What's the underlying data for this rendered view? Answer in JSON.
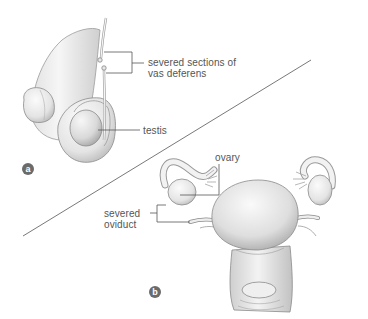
{
  "figure": {
    "panel_a": {
      "badge": "a",
      "labels": {
        "vas_deferens_line1": "severed sections of",
        "vas_deferens_line2": "vas deferens",
        "testis": "testis"
      }
    },
    "panel_b": {
      "badge": "b",
      "labels": {
        "ovary": "ovary",
        "oviduct_line1": "severed",
        "oviduct_line2": "oviduct"
      }
    },
    "colors": {
      "leader_line": "#555555",
      "label_text": "#555555",
      "badge_fill": "#6b6b6b",
      "tissue_light": "#f2f2f2",
      "tissue_shade": "#c8c8c8",
      "tissue_outline": "#8a8a8a"
    }
  }
}
